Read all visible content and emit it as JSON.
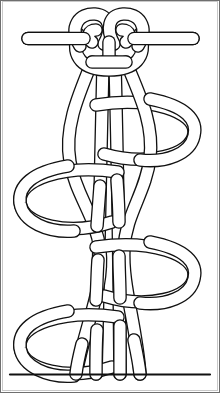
{
  "figure": {
    "kind": "line-drawing",
    "width_px": 220,
    "height_px": 393,
    "background_color": "#ffffff",
    "line_color": "#111111",
    "frame_color": "#6f6f6f",
    "frame_inner_color": "#c9c9c9",
    "rope_interior_color": "#ffffff",
    "rope_line_width_px": 2.6,
    "rope_band_width_px": 11
  },
  "structure": {
    "description": "Vertical four-strand braided knot column hanging from a horizontal double rope at the top, with alternating side loops descending to a bottom rail.",
    "top_rail": {
      "name": "horizontal rope",
      "left_x": 28,
      "right_x": 193,
      "upper_line_y": 33,
      "lower_line_y": 44
    },
    "top_knot": {
      "name": "double bight crown knot",
      "center_x": 109,
      "top_y": 14,
      "bottom_y": 66,
      "left_bight_center_x": 92,
      "right_bight_center_x": 126,
      "bight_radius": 21
    },
    "descending_strands": [
      {
        "name": "strand-1",
        "top_x": 92,
        "bottom_x": 76
      },
      {
        "name": "strand-2",
        "top_x": 103,
        "bottom_x": 96
      },
      {
        "name": "strand-3",
        "top_x": 115,
        "bottom_x": 120
      },
      {
        "name": "strand-4",
        "top_x": 126,
        "bottom_x": 140
      }
    ],
    "side_loops": [
      {
        "name": "loop-right-1",
        "side": "right",
        "center_x": 152,
        "center_y": 130,
        "rx": 44,
        "ry": 32
      },
      {
        "name": "loop-left-1",
        "side": "left",
        "center_x": 66,
        "center_y": 196,
        "rx": 44,
        "ry": 32
      },
      {
        "name": "loop-right-2",
        "side": "right",
        "center_x": 152,
        "center_y": 272,
        "rx": 44,
        "ry": 32
      },
      {
        "name": "loop-left-2",
        "side": "left",
        "center_x": 66,
        "center_y": 341,
        "rx": 44,
        "ry": 32
      }
    ],
    "bottom_rail": {
      "name": "bottom edge line",
      "left_x": 10,
      "right_x": 210,
      "y": 374
    },
    "strand_count": 4,
    "loop_count": 4
  }
}
